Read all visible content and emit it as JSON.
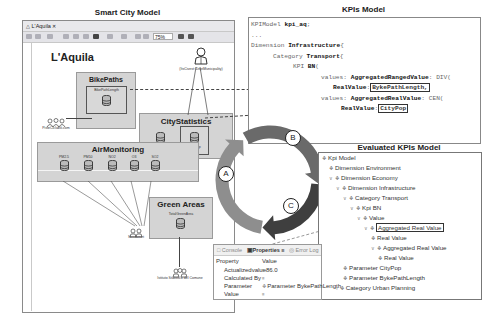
{
  "titles": {
    "smart_city": "Smart City Model",
    "kpis": "KPIs Model",
    "evaluated": "Evaluated KPIs Model"
  },
  "city_window": {
    "tab_label": "L'Aquila",
    "zoom_level": "75%",
    "city_name": "L'Aquila",
    "actor_label": "(ItsCivest: DeptMunicipality)",
    "groups": {
      "bike_paths": {
        "title": "BikePaths",
        "source": "BikePathLength",
        "provider": "PisteCiclabili.com"
      },
      "city_statistics": {
        "title": "CityStatistics",
        "sources": [
          "CityExt",
          "CityPop"
        ]
      },
      "air_monitoring": {
        "title": "AirMonitoring",
        "sensors": [
          "PM2.5",
          "PM10",
          "NO2",
          "O3",
          "SO2"
        ],
        "provider": "Sensornet"
      },
      "green_areas": {
        "title": "Green Areas",
        "source": "TotalGreenArea",
        "provider": "Istituto Statistico del Comune"
      }
    }
  },
  "cycle": {
    "labels": [
      "A",
      "B",
      "C"
    ],
    "colors": {
      "a": "#8e8e8e",
      "b": "#6a6a6a",
      "c": "#3f3f3f"
    }
  },
  "kpi_code": {
    "lines": [
      {
        "t": "KPIModel ",
        "b": "kpi_aq",
        "r": ";"
      },
      {
        "t": "..."
      },
      {
        "t": "Dimension ",
        "b": "Infrastructure",
        "r": "{"
      },
      {
        "t": "Category ",
        "b": "Transport",
        "r": "{"
      },
      {
        "t": "KPI ",
        "b": "BN",
        "r": "("
      },
      {
        "t": "values: ",
        "b": "AggregatedRangedValue",
        "r": ": DIV("
      },
      {
        "b": "RealValue",
        "r": ":",
        "boxed": "BykePathLength,"
      },
      {
        "t": "values: ",
        "b": "AggregatedRealValue",
        "r": ": CEN("
      },
      {
        "b": "RealValue",
        "r": ":",
        "boxed": "CityPop"
      }
    ]
  },
  "evaluated_tree": [
    {
      "label": "Kpi Model",
      "level": 0,
      "chev": ""
    },
    {
      "label": "Dimension Environment",
      "level": 1,
      "chev": ""
    },
    {
      "label": "Dimension Economy",
      "level": 1,
      "chev": "v"
    },
    {
      "label": "Dimension Infrastructure",
      "level": 2,
      "chev": "v"
    },
    {
      "label": "Category Transport",
      "level": 3,
      "chev": "v"
    },
    {
      "label": "Kpi BN",
      "level": 4,
      "chev": "v"
    },
    {
      "label": "Value",
      "level": 5,
      "chev": "v"
    },
    {
      "label": "Aggregated Real Value",
      "level": 6,
      "chev": "v",
      "highlight": true
    },
    {
      "label": "Real Value",
      "level": 7,
      "chev": ""
    },
    {
      "label": "Aggregated Real Value",
      "level": 7,
      "chev": "v"
    },
    {
      "label": "Real Value",
      "level": 8,
      "chev": ""
    },
    {
      "label": "Parameter CityPop",
      "level": 3,
      "chev": ""
    },
    {
      "label": "Parameter BykePathLength",
      "level": 3,
      "chev": ""
    },
    {
      "label": "Category Urban Planning",
      "level": 2,
      "chev": ">"
    }
  ],
  "properties_panel": {
    "tabs": [
      "Console",
      "Properties",
      "Error Log",
      "Probl"
    ],
    "header": {
      "property": "Property",
      "value": "Value"
    },
    "rows": [
      {
        "property": "Actualizedvalue",
        "value": "86.0"
      },
      {
        "property": "Calculated By",
        "value": ""
      },
      {
        "property": "Parameter",
        "value": "Parameter BykePathLength"
      },
      {
        "property": "Value",
        "value": ""
      }
    ]
  }
}
